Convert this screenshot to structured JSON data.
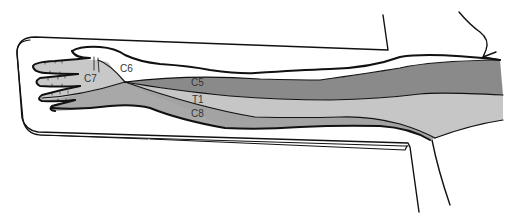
{
  "diagram": {
    "colors": {
      "background": "#ffffff",
      "outline": "#111111",
      "c5": "#8a8a8a",
      "t1": "#c4c4c4",
      "c8": "#a3a3a3",
      "c7": "#c8c8c8",
      "c6": "#ffffff",
      "hand_dorsum": "#a8a8a8"
    },
    "labels": {
      "c6": "C6",
      "c7": "C7",
      "c5": "C5",
      "t1": "T1",
      "c8": "C8"
    }
  }
}
